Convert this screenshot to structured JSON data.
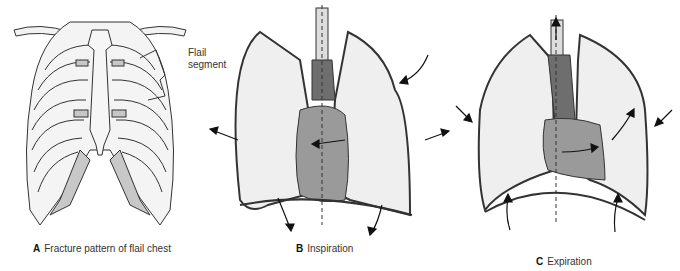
{
  "figure": {
    "panels": [
      {
        "letter": "A",
        "caption": "Fracture pattern of flail chest"
      },
      {
        "letter": "B",
        "caption": "Inspiration"
      },
      {
        "letter": "C",
        "caption": "Expiration"
      }
    ],
    "annotations": {
      "flail_line1": "Flail",
      "flail_line2": "segment"
    },
    "colors": {
      "outline": "#333333",
      "lung_fill": "#efefef",
      "heart_fill": "#9a9a9a",
      "trachea_fill": "#6e6e6e",
      "cartilage_fill": "#c8c8c8"
    }
  }
}
